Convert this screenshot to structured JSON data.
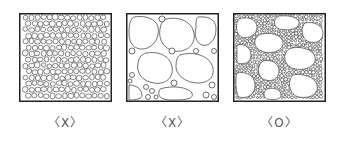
{
  "panels": [
    {
      "id": "uniform-small",
      "description": "Uniform small aggregate only",
      "label": "〈X〉"
    },
    {
      "id": "large-with-small",
      "description": "Large aggregate with few small particles",
      "label": "〈X〉"
    },
    {
      "id": "well-graded",
      "description": "Well-graded mix of large and small aggregate",
      "label": "〈O〉"
    }
  ],
  "colors": {
    "stroke": "#222222",
    "background": "#ffffff",
    "label": "#555555"
  }
}
